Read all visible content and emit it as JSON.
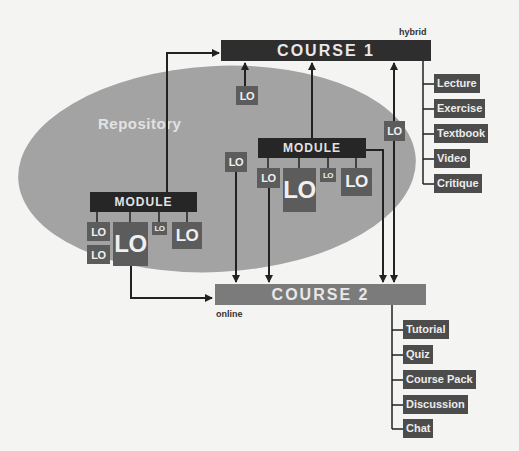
{
  "diagram": {
    "repository_label": "Repository",
    "course1": {
      "label": "COURSE 1",
      "tag": "hybrid",
      "items": [
        "Lecture",
        "Exercise",
        "Textbook",
        "Video",
        "Critique"
      ]
    },
    "course2": {
      "label": "COURSE 2",
      "tag": "online",
      "items": [
        "Tutorial",
        "Quiz",
        "Course Pack",
        "Discussion",
        "Chat"
      ]
    },
    "module_left": {
      "label": "MODULE",
      "los": [
        "LO",
        "LO",
        "LO",
        "LO",
        "LO"
      ]
    },
    "module_right": {
      "label": "MODULE",
      "los": [
        "LO",
        "LO",
        "LO",
        "LO"
      ]
    },
    "standalone_los": [
      "LO",
      "LO",
      "LO"
    ],
    "colors": {
      "background": "#f4f4f2",
      "repository": "#a3a3a3",
      "course1": "#2e2e2e",
      "course2": "#7b7b7b",
      "module": "#262626",
      "lo": "#5c5c5c",
      "item": "#4c4c4c"
    }
  }
}
